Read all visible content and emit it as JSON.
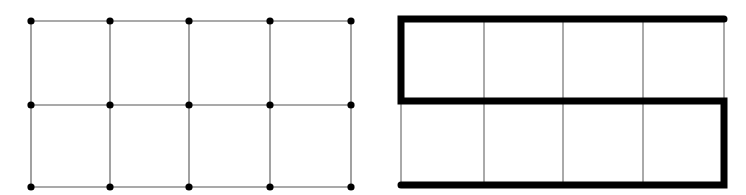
{
  "diagram": {
    "type": "grid-graph-hamiltonian-path",
    "colors": {
      "background": "#ffffff",
      "thin_line": "#555555",
      "thick_line": "#000000",
      "dot": "#000000"
    },
    "left_grid": {
      "rows": 2,
      "cols": 4,
      "x": [
        31,
        110,
        189,
        270,
        351
      ],
      "y": [
        21,
        105,
        187
      ],
      "dot_radius": 3.6,
      "line_width": 1.1
    },
    "right_grid": {
      "rows": 2,
      "cols": 4,
      "x": [
        401,
        484,
        563,
        643,
        724
      ],
      "y": [
        19,
        101,
        185
      ],
      "line_width": 1.0,
      "path_width": 7,
      "path": [
        [
          724,
          19
        ],
        [
          401,
          19
        ],
        [
          401,
          101
        ],
        [
          724,
          101
        ],
        [
          724,
          185
        ],
        [
          401,
          185
        ]
      ]
    }
  }
}
